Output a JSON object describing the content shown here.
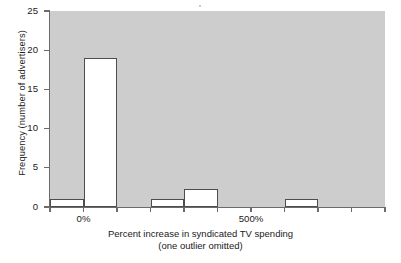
{
  "chart_data": {
    "type": "bar",
    "title": "",
    "subtitle": "",
    "xlabel": "Percent increase in syndicated TV spending",
    "xlabel_line2": "(one outlier omitted)",
    "ylabel": "Frequency (number of advertisers)",
    "xlim": [
      -100,
      900
    ],
    "ylim": [
      0,
      25
    ],
    "bin_width": 100,
    "grid": false,
    "legend": null,
    "x_tick_labels": [
      "0%",
      "500%"
    ],
    "x_tick_values": [
      0,
      500
    ],
    "x_tick_all_values": [
      -100,
      0,
      100,
      200,
      300,
      400,
      500,
      600,
      700,
      800,
      900
    ],
    "y_tick_labels": [
      "0",
      "5",
      "10",
      "15",
      "20",
      "25"
    ],
    "y_tick_values": [
      0,
      5,
      10,
      15,
      20,
      25
    ],
    "categories": [
      "-100% to 0%",
      "0% to 100%",
      "100% to 200%",
      "200% to 300%",
      "300% to 400%",
      "400% to 500%",
      "500% to 600%",
      "600% to 700%",
      "700% to 800%",
      "800% to 900%"
    ],
    "bin_starts": [
      -100,
      0,
      100,
      200,
      300,
      400,
      500,
      600,
      700,
      800
    ],
    "values": [
      1,
      19,
      0,
      1,
      2.3,
      0,
      0,
      1,
      0,
      0
    ],
    "bars": [
      {
        "label": "bin--100-0",
        "x0": -100,
        "x1": 0,
        "value": 1
      },
      {
        "label": "bin-0-100",
        "x0": 0,
        "x1": 100,
        "value": 19
      },
      {
        "label": "bin-200-300",
        "x0": 200,
        "x1": 300,
        "value": 1
      },
      {
        "label": "bin-300-400",
        "x0": 300,
        "x1": 400,
        "value": 2.3
      },
      {
        "label": "bin-600-700",
        "x0": 600,
        "x1": 700,
        "value": 1
      }
    ],
    "colors": {
      "plot_background": "#cdcdcd",
      "bar_fill": "#ffffff",
      "bar_edge": "#4d4d4d",
      "axis": "#6b6b6b",
      "text": "#1a1a1a",
      "page_background": "#ffffff"
    }
  }
}
